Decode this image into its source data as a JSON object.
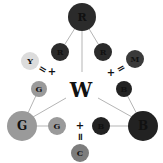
{
  "diagram": {
    "center_label": "W",
    "colors": {
      "red": "#2b2b2b",
      "green": "#9a9a9a",
      "blue": "#222222",
      "yellow": "#dcdcdc",
      "magenta": "#3a3a3a",
      "cyan": "#7d7d7d",
      "line": "#b5b5b5",
      "text_dark": "#111111"
    },
    "nodes": {
      "r_big": {
        "label": "R"
      },
      "r_left": {
        "label": "R"
      },
      "r_right": {
        "label": "R"
      },
      "y": {
        "label": "Y"
      },
      "m": {
        "label": "M"
      },
      "g_upper": {
        "label": "G"
      },
      "b_upper": {
        "label": "B"
      },
      "g_big": {
        "label": "G"
      },
      "g_right": {
        "label": "G"
      },
      "b_big": {
        "label": "B"
      },
      "b_left": {
        "label": "B"
      },
      "c": {
        "label": "C"
      }
    },
    "operators": {
      "left_eq": "=",
      "left_plus": "+",
      "right_eq": "=",
      "right_plus": "+",
      "bottom_plus": "+",
      "bottom_eq": "="
    }
  }
}
